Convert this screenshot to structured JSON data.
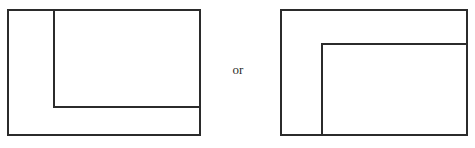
{
  "figure": {
    "background_color": "#ffffff",
    "stroke_color": "#2b2b2b",
    "stroke_width": 1.2,
    "connector": {
      "text": "or",
      "x": 226,
      "y": 62
    },
    "diagrams": [
      {
        "name": "left-diagram",
        "label": "outer rectangle with inner rectangle flush to top-right",
        "outer_rect": {
          "x": 8,
          "y": 10,
          "width": 192,
          "height": 125
        },
        "inner_rect": {
          "x": 54,
          "y": 10,
          "width": 146,
          "height": 97
        },
        "inner_anchor": "top-right",
        "inner_corner": {
          "x": 54,
          "y": 107
        },
        "visible_inner_edges": [
          "left",
          "bottom"
        ]
      },
      {
        "name": "right-diagram",
        "label": "outer rectangle with inner rectangle flush to bottom-right",
        "outer_rect": {
          "x": 281,
          "y": 10,
          "width": 186,
          "height": 125
        },
        "inner_rect": {
          "x": 322,
          "y": 44,
          "width": 145,
          "height": 91
        },
        "inner_anchor": "bottom-right",
        "inner_corner": {
          "x": 322,
          "y": 44
        },
        "visible_inner_edges": [
          "left",
          "top"
        ]
      }
    ]
  }
}
